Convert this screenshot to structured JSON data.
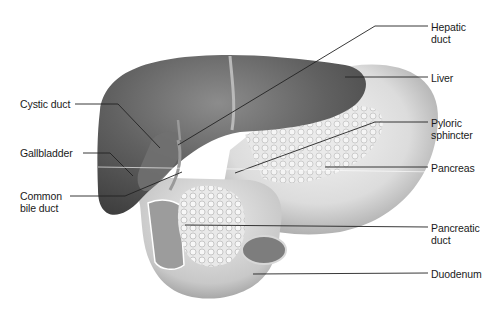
{
  "figure": {
    "colors": {
      "background": "#ffffff",
      "liver": "#5e5e5e",
      "liver_highlight": "#8a8a8a",
      "stomach": "#d6d6d6",
      "pancreas": "#e8e8e8",
      "duodenum": "#cfcfcf",
      "leader_line": "#222222",
      "text": "#1a1a1a"
    },
    "labels_left": [
      {
        "id": "cystic-duct",
        "text": "Cystic duct",
        "x": 20,
        "y": 98
      },
      {
        "id": "gallbladder",
        "text": "Gallbladder",
        "x": 20,
        "y": 147
      },
      {
        "id": "common-bile-duct",
        "text": "Common\nbile duct",
        "x": 20,
        "y": 190
      }
    ],
    "labels_right": [
      {
        "id": "hepatic-duct",
        "text": "Hepatic\nduct",
        "x": 431,
        "y": 21
      },
      {
        "id": "liver",
        "text": "Liver",
        "x": 431,
        "y": 72
      },
      {
        "id": "pyloric-sphincter",
        "text": "Pyloric\nsphincter",
        "x": 431,
        "y": 117
      },
      {
        "id": "pancreas",
        "text": "Pancreas",
        "x": 431,
        "y": 162
      },
      {
        "id": "pancreatic-duct",
        "text": "Pancreatic\nduct",
        "x": 431,
        "y": 222
      },
      {
        "id": "duodenum",
        "text": "Duodenum",
        "x": 431,
        "y": 268
      }
    ]
  }
}
